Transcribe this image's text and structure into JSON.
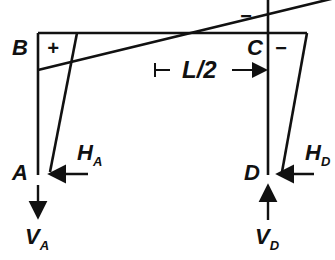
{
  "diagram": {
    "type": "portal frame bending moment diagram",
    "nodes": {
      "B": "B",
      "C": "C",
      "A": "A",
      "D": "D"
    },
    "signs": {
      "plus": "+",
      "minus_top": "−",
      "minus_right": "−"
    },
    "dimension": "L/2",
    "reactions": {
      "HA": {
        "main": "H",
        "sub": "A"
      },
      "VA": {
        "main": "V",
        "sub": "A"
      },
      "HD": {
        "main": "H",
        "sub": "D"
      },
      "VD": {
        "main": "V",
        "sub": "D"
      }
    }
  }
}
